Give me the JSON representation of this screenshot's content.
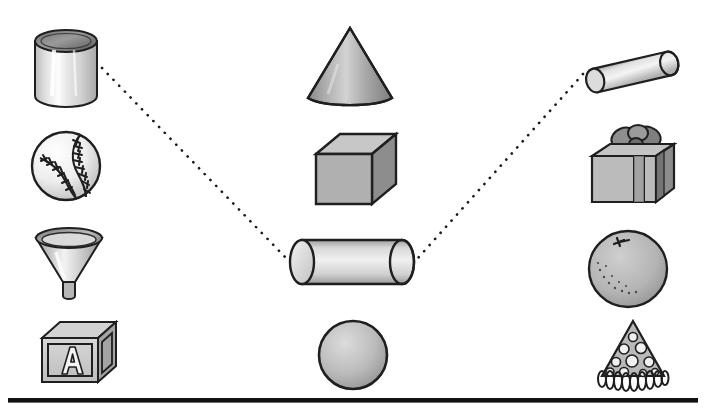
{
  "worksheet": {
    "title": "Match the real-world object to the matching solid figure",
    "type": "matching-worksheet",
    "width": 706,
    "height": 416,
    "background_color": "#ffffff",
    "rule_color": "#111111"
  },
  "columns": {
    "left": {
      "name": "real-objects-left",
      "items": [
        {
          "id": "tin-can",
          "label": "Tin can",
          "solid": "cylinder",
          "x": 30,
          "y": 26,
          "w": 70,
          "h": 82
        },
        {
          "id": "baseball",
          "label": "Baseball",
          "solid": "sphere",
          "x": 28,
          "y": 128,
          "w": 74,
          "h": 74
        },
        {
          "id": "funnel",
          "label": "Funnel",
          "solid": "cone",
          "x": 30,
          "y": 224,
          "w": 76,
          "h": 78
        },
        {
          "id": "alphabet-block",
          "label": "Alphabet block",
          "solid": "cube",
          "x": 38,
          "y": 318,
          "w": 80,
          "h": 68
        }
      ]
    },
    "middle": {
      "name": "solid-figures-middle",
      "items": [
        {
          "id": "cone",
          "label": "Cone",
          "x": 300,
          "y": 24,
          "w": 98,
          "h": 88
        },
        {
          "id": "cube",
          "label": "Cube",
          "x": 310,
          "y": 130,
          "w": 90,
          "h": 80
        },
        {
          "id": "cylinder",
          "label": "Cylinder",
          "x": 284,
          "y": 234,
          "w": 134,
          "h": 54
        },
        {
          "id": "sphere",
          "label": "Sphere",
          "x": 314,
          "y": 318,
          "w": 78,
          "h": 74
        }
      ]
    },
    "right": {
      "name": "real-objects-right",
      "items": [
        {
          "id": "rolling-pin",
          "label": "Rolling pin",
          "solid": "cylinder",
          "x": 580,
          "y": 46,
          "w": 102,
          "h": 48
        },
        {
          "id": "gift-box",
          "label": "Gift box",
          "solid": "cube",
          "x": 586,
          "y": 122,
          "w": 92,
          "h": 88
        },
        {
          "id": "orange",
          "label": "Orange",
          "solid": "sphere",
          "x": 584,
          "y": 226,
          "w": 86,
          "h": 84
        },
        {
          "id": "party-hat",
          "label": "Party hat",
          "solid": "cone",
          "x": 588,
          "y": 318,
          "w": 88,
          "h": 74
        }
      ]
    }
  },
  "connections": [
    {
      "id": "connection-can-to-cylinder",
      "from": "tin-can",
      "to": "cylinder",
      "style": "dotted",
      "color": "#1b1b1b",
      "x1": 102,
      "y1": 68,
      "x2": 286,
      "y2": 258
    },
    {
      "id": "connection-rollingpin-to-cylinder",
      "from": "rolling-pin",
      "to": "cylinder",
      "style": "dotted",
      "color": "#1b1b1b",
      "x1": 583,
      "y1": 74,
      "x2": 418,
      "y2": 258
    }
  ],
  "palette": {
    "outline": "#1f1f1f",
    "light_gray": "#e9e9e9",
    "mid_gray": "#b9b9b9",
    "dark_gray": "#8f8f8f",
    "shadow_gray": "#6f6f6f",
    "highlight": "#fafafa"
  }
}
